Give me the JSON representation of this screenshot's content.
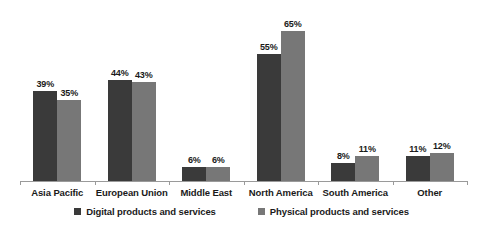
{
  "chart_data": {
    "type": "bar",
    "title": "",
    "subtitle": "",
    "xlabel": "",
    "ylabel": "",
    "ylim": [
      0,
      75
    ],
    "grid": false,
    "legend_position": "bottom",
    "value_suffix": "%",
    "categories": [
      "Asia Pacific",
      "European Union",
      "Middle East",
      "North America",
      "South America",
      "Other"
    ],
    "series": [
      {
        "name": "Digital products and services",
        "color": "#3a3a3a",
        "values": [
          39,
          44,
          6,
          55,
          8,
          11
        ],
        "labels": [
          "39%",
          "44%",
          "6%",
          "55%",
          "8%",
          "11%"
        ]
      },
      {
        "name": "Physical products and services",
        "color": "#777777",
        "values": [
          35,
          43,
          6,
          65,
          11,
          12
        ],
        "labels": [
          "35%",
          "43%",
          "6%",
          "65%",
          "11%",
          "12%"
        ]
      }
    ]
  },
  "axis": {
    "line_color": "#9a9a9a"
  }
}
